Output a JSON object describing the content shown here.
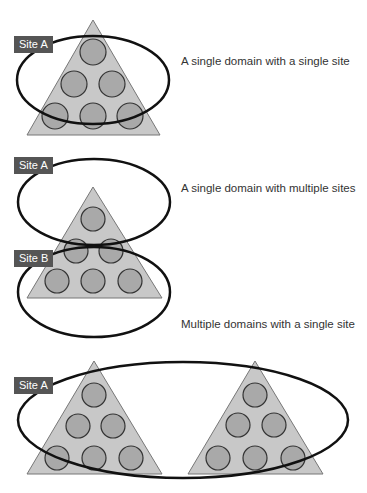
{
  "colors": {
    "triangle_fill": "#c8c8c8",
    "triangle_stroke": "#777777",
    "circle_fill": "#a9a9a9",
    "circle_stroke": "#333333",
    "ellipse_stroke": "#111111",
    "label_bg": "#555555",
    "label_text": "#ffffff",
    "caption_text": "#333333"
  },
  "diagrams": [
    {
      "caption": "A single domain with a single site",
      "labels": [
        "Site A"
      ]
    },
    {
      "caption": "A single domain with multiple sites",
      "labels": [
        "Site A",
        "Site B"
      ]
    },
    {
      "caption": "Multiple domains with a single site",
      "labels": [
        "Site A"
      ]
    }
  ]
}
